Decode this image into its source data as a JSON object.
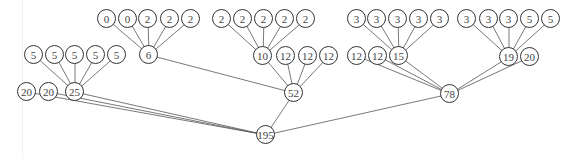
{
  "diagram": {
    "type": "tree",
    "root": "n195",
    "nodes": [
      {
        "id": "n195",
        "label": "195",
        "x": 266,
        "y": 135
      },
      {
        "id": "n25",
        "label": "25",
        "x": 75,
        "y": 92
      },
      {
        "id": "n20a",
        "label": "20",
        "x": 27,
        "y": 92
      },
      {
        "id": "n20b",
        "label": "20",
        "x": 49,
        "y": 92
      },
      {
        "id": "n52",
        "label": "52",
        "x": 294,
        "y": 93
      },
      {
        "id": "n78",
        "label": "78",
        "x": 450,
        "y": 94
      },
      {
        "id": "n5a",
        "label": "5",
        "x": 34,
        "y": 55
      },
      {
        "id": "n5b",
        "label": "5",
        "x": 55,
        "y": 55
      },
      {
        "id": "n5c",
        "label": "5",
        "x": 75,
        "y": 55
      },
      {
        "id": "n5d",
        "label": "5",
        "x": 96,
        "y": 55
      },
      {
        "id": "n5e",
        "label": "5",
        "x": 117,
        "y": 55
      },
      {
        "id": "n6",
        "label": "6",
        "x": 149,
        "y": 55
      },
      {
        "id": "n0a",
        "label": "0",
        "x": 107,
        "y": 19
      },
      {
        "id": "n0b",
        "label": "0",
        "x": 128,
        "y": 19
      },
      {
        "id": "n2a",
        "label": "2",
        "x": 148,
        "y": 19
      },
      {
        "id": "n2b",
        "label": "2",
        "x": 170,
        "y": 19
      },
      {
        "id": "n2c",
        "label": "2",
        "x": 191,
        "y": 19
      },
      {
        "id": "n10",
        "label": "10",
        "x": 263,
        "y": 56
      },
      {
        "id": "n12a",
        "label": "12",
        "x": 286,
        "y": 56
      },
      {
        "id": "n12b",
        "label": "12",
        "x": 308,
        "y": 56
      },
      {
        "id": "n12c",
        "label": "12",
        "x": 329,
        "y": 56
      },
      {
        "id": "n2d",
        "label": "2",
        "x": 222,
        "y": 19
      },
      {
        "id": "n2e",
        "label": "2",
        "x": 243,
        "y": 19
      },
      {
        "id": "n2f",
        "label": "2",
        "x": 264,
        "y": 19
      },
      {
        "id": "n2g",
        "label": "2",
        "x": 285,
        "y": 19
      },
      {
        "id": "n2h",
        "label": "2",
        "x": 306,
        "y": 19
      },
      {
        "id": "n12d",
        "label": "12",
        "x": 357,
        "y": 56
      },
      {
        "id": "n12e",
        "label": "12",
        "x": 378,
        "y": 56
      },
      {
        "id": "n15",
        "label": "15",
        "x": 399,
        "y": 56
      },
      {
        "id": "n3a",
        "label": "3",
        "x": 357,
        "y": 19
      },
      {
        "id": "n3b",
        "label": "3",
        "x": 377,
        "y": 19
      },
      {
        "id": "n3c",
        "label": "3",
        "x": 398,
        "y": 19
      },
      {
        "id": "n3d",
        "label": "3",
        "x": 419,
        "y": 19
      },
      {
        "id": "n3e",
        "label": "3",
        "x": 440,
        "y": 19
      },
      {
        "id": "n19",
        "label": "19",
        "x": 509,
        "y": 57
      },
      {
        "id": "n20c",
        "label": "20",
        "x": 530,
        "y": 57
      },
      {
        "id": "n3f",
        "label": "3",
        "x": 467,
        "y": 19
      },
      {
        "id": "n3g",
        "label": "3",
        "x": 489,
        "y": 19
      },
      {
        "id": "n3h",
        "label": "3",
        "x": 509,
        "y": 19
      },
      {
        "id": "n5f",
        "label": "5",
        "x": 530,
        "y": 19
      },
      {
        "id": "n5g",
        "label": "5",
        "x": 551,
        "y": 19
      }
    ],
    "edges": [
      [
        "n195",
        "n20a"
      ],
      [
        "n195",
        "n20b"
      ],
      [
        "n195",
        "n25"
      ],
      [
        "n195",
        "n52"
      ],
      [
        "n195",
        "n78"
      ],
      [
        "n25",
        "n5a"
      ],
      [
        "n25",
        "n5b"
      ],
      [
        "n25",
        "n5c"
      ],
      [
        "n25",
        "n5d"
      ],
      [
        "n25",
        "n5e"
      ],
      [
        "n52",
        "n6"
      ],
      [
        "n52",
        "n10"
      ],
      [
        "n52",
        "n12a"
      ],
      [
        "n52",
        "n12b"
      ],
      [
        "n52",
        "n12c"
      ],
      [
        "n6",
        "n0a"
      ],
      [
        "n6",
        "n0b"
      ],
      [
        "n6",
        "n2a"
      ],
      [
        "n6",
        "n2b"
      ],
      [
        "n6",
        "n2c"
      ],
      [
        "n10",
        "n2d"
      ],
      [
        "n10",
        "n2e"
      ],
      [
        "n10",
        "n2f"
      ],
      [
        "n10",
        "n2g"
      ],
      [
        "n10",
        "n2h"
      ],
      [
        "n78",
        "n12d"
      ],
      [
        "n78",
        "n12e"
      ],
      [
        "n78",
        "n15"
      ],
      [
        "n78",
        "n19"
      ],
      [
        "n78",
        "n20c"
      ],
      [
        "n15",
        "n3a"
      ],
      [
        "n15",
        "n3b"
      ],
      [
        "n15",
        "n3c"
      ],
      [
        "n15",
        "n3d"
      ],
      [
        "n15",
        "n3e"
      ],
      [
        "n19",
        "n3f"
      ],
      [
        "n19",
        "n3g"
      ],
      [
        "n19",
        "n3h"
      ],
      [
        "n19",
        "n5f"
      ],
      [
        "n19",
        "n5g"
      ]
    ],
    "colors": {
      "stroke": "#333333",
      "edge": "#555555",
      "text": "#444444",
      "fill": "#ffffff"
    }
  }
}
